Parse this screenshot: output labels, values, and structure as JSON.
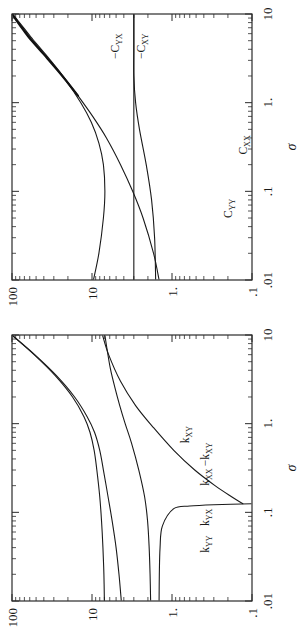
{
  "figure": {
    "orientation_deg": -90,
    "panel_count": 2,
    "ink_color": "#1a1a1a",
    "background": "#ffffff",
    "caption_fragment": ""
  },
  "chart_data": [
    {
      "id": "panel-a-stiffness",
      "type": "line",
      "title": "",
      "subtitle": "",
      "xlabel": "σ",
      "ylabel": "",
      "xscale": "log",
      "yscale": "log",
      "xlim": [
        0.01,
        10
      ],
      "ylim": [
        0.1,
        100
      ],
      "xticks": [
        0.01,
        0.1,
        1,
        10
      ],
      "xtick_labels": [
        ".01",
        ".1",
        "1.",
        "10"
      ],
      "yticks": [
        0.1,
        1,
        10,
        100
      ],
      "ytick_labels": [
        ".1",
        "1.",
        "10",
        "100"
      ],
      "grid": false,
      "legend_position": "inline-labels",
      "minor_ticks": true,
      "series": [
        {
          "name": "k_YY",
          "label": "k",
          "sub": "YY",
          "prefix": "",
          "linewidth": "normal",
          "x": [
            0.01,
            0.02,
            0.04,
            0.08,
            0.15,
            0.3,
            0.5,
            0.8,
            1.2,
            2.0,
            3.5,
            6.0,
            10.0
          ],
          "y": [
            4.3,
            4.6,
            5.0,
            5.6,
            6.3,
            7.2,
            8.0,
            9.3,
            11.5,
            16.5,
            28.0,
            52.0,
            100.0
          ]
        },
        {
          "name": "k_YX",
          "label": "k",
          "sub": "YX",
          "prefix": "",
          "linewidth": "normal",
          "x": [
            0.01,
            0.02,
            0.04,
            0.08,
            0.15,
            0.3,
            0.5,
            0.8,
            1.2,
            2.0,
            3.5,
            6.0,
            10.0
          ],
          "y": [
            7.0,
            7.1,
            7.3,
            7.6,
            8.0,
            8.7,
            9.4,
            10.6,
            12.6,
            17.5,
            29.0,
            53.0,
            101.0
          ]
        },
        {
          "name": "k_XX",
          "label": "k",
          "sub": "XX",
          "prefix": "",
          "linewidth": "normal",
          "x": [
            0.01,
            0.02,
            0.04,
            0.08,
            0.15,
            0.3,
            0.6,
            1.0,
            1.6,
            2.6,
            4.2,
            7.0,
            10.0
          ],
          "y": [
            1.85,
            1.88,
            1.93,
            2.02,
            2.2,
            2.6,
            3.2,
            3.85,
            4.5,
            5.2,
            5.9,
            6.5,
            6.9
          ]
        },
        {
          "name": "k_XY_positive",
          "label": "k",
          "sub": "XY",
          "prefix": "",
          "linewidth": "normal",
          "x": [
            0.125,
            0.15,
            0.2,
            0.3,
            0.5,
            0.9,
            1.6,
            3.0,
            6.0,
            10.0
          ],
          "y": [
            0.13,
            0.18,
            0.29,
            0.52,
            0.95,
            1.7,
            2.85,
            4.4,
            6.2,
            7.4
          ]
        },
        {
          "name": "k_XY_negative",
          "label": "k",
          "sub": "XY",
          "prefix": "−",
          "linewidth": "normal",
          "x": [
            0.01,
            0.02,
            0.04,
            0.07,
            0.11,
            0.118,
            0.122,
            0.125
          ],
          "y": [
            1.45,
            1.44,
            1.41,
            1.32,
            0.95,
            0.6,
            0.3,
            0.1
          ]
        }
      ],
      "annotations": [
        {
          "text": "k",
          "sub": "YY",
          "prefix": "",
          "x": 0.035,
          "y": 0.34
        },
        {
          "text": "k",
          "sub": "YX",
          "prefix": "",
          "x": 0.07,
          "y": 0.34
        },
        {
          "text": "k",
          "sub": "XX",
          "prefix": "",
          "x": 0.2,
          "y": 0.34
        },
        {
          "text": "k",
          "sub": "XY",
          "prefix": "−",
          "x": 0.33,
          "y": 0.34
        },
        {
          "text": "k",
          "sub": "XY",
          "prefix": "",
          "x": 0.6,
          "y": 0.62
        }
      ]
    },
    {
      "id": "panel-b-damping",
      "type": "line",
      "title": "",
      "subtitle": "",
      "xlabel": "σ",
      "ylabel": "",
      "xscale": "log",
      "yscale": "log",
      "xlim": [
        0.01,
        10
      ],
      "ylim": [
        0.1,
        100
      ],
      "xticks": [
        0.01,
        0.1,
        1,
        10
      ],
      "xtick_labels": [
        ".01",
        ".1",
        "1.",
        "10"
      ],
      "yticks": [
        0.1,
        1,
        10,
        100
      ],
      "ytick_labels": [
        ".1",
        "1.",
        "10",
        "100"
      ],
      "grid": false,
      "legend_position": "inline-labels",
      "minor_ticks": true,
      "series": [
        {
          "name": "C_YY",
          "label": "C",
          "sub": "YY",
          "prefix": "",
          "linewidth": "normal",
          "x": [
            0.01,
            0.02,
            0.05,
            0.1,
            0.2,
            0.35,
            0.6,
            1.0,
            1.8,
            3.0,
            5.0,
            7.5,
            10.0
          ],
          "y": [
            9.6,
            8.2,
            7.2,
            6.9,
            7.2,
            8.2,
            10.2,
            13.8,
            21.5,
            34.0,
            55.0,
            78.0,
            100.0
          ]
        },
        {
          "name": "C_XX",
          "label": "C",
          "sub": "XX",
          "prefix": "",
          "linewidth": "normal",
          "x": [
            0.01,
            0.02,
            0.05,
            0.1,
            0.2,
            0.4,
            0.7,
            1.2,
            2.0,
            3.5,
            5.5,
            7.5,
            10.0
          ],
          "y": [
            1.45,
            1.7,
            2.3,
            3.1,
            4.4,
            6.6,
            9.8,
            15.0,
            23.0,
            38.0,
            58.0,
            76.0,
            98.0
          ]
        },
        {
          "name": "C_YX",
          "label": "C",
          "sub": "YX",
          "prefix": "−",
          "linewidth": "normal",
          "x": [
            0.01,
            0.1,
            0.5,
            1.0,
            3.0,
            6.0,
            10.0
          ],
          "y": [
            3.0,
            3.0,
            3.0,
            3.0,
            3.0,
            3.0,
            3.0
          ]
        },
        {
          "name": "C_XY",
          "label": "C",
          "sub": "XY",
          "prefix": "−",
          "linewidth": "normal",
          "x": [
            0.01,
            0.03,
            0.08,
            0.2,
            0.5,
            1.0,
            2.0,
            4.0,
            7.0,
            10.0
          ],
          "y": [
            1.6,
            1.65,
            1.8,
            2.1,
            2.55,
            2.85,
            3.0,
            3.0,
            3.0,
            3.0
          ]
        },
        {
          "name": "envelope_thick",
          "label": "",
          "sub": "",
          "prefix": "",
          "linewidth": "thick",
          "x": [
            1.2,
            2.0,
            3.5,
            5.5,
            7.5,
            10.0
          ],
          "y": [
            15.0,
            23.5,
            40.0,
            62.0,
            80.0,
            100.0
          ]
        }
      ],
      "annotations": [
        {
          "text": "C",
          "sub": "YY",
          "prefix": "",
          "x": 0.05,
          "y": 0.18
        },
        {
          "text": "C",
          "sub": "XX",
          "prefix": "",
          "x": 0.26,
          "y": 0.115
        },
        {
          "text": "C",
          "sub": "YX",
          "prefix": "−",
          "x": 3.1,
          "y": 4.6
        },
        {
          "text": "C",
          "sub": "XY",
          "prefix": "−",
          "x": 3.1,
          "y": 2.15
        }
      ]
    }
  ]
}
